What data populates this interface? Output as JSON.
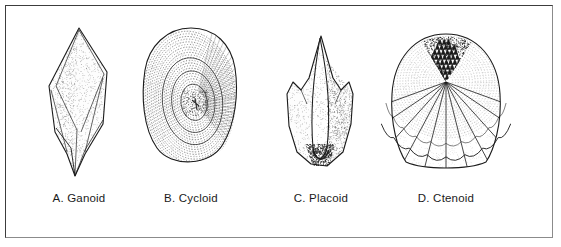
{
  "figure": {
    "background_color": "#ffffff",
    "border_color": "#3c3c3c",
    "ink_color": "#1b1b1b",
    "width": 561,
    "height": 247,
    "caption_font_size": "11.5px"
  },
  "plates": [
    {
      "key": "A.",
      "name": "Ganoid",
      "label": "A.  Ganoid",
      "icon": "ganoid-scale-illustration",
      "description": "rhomboid diamond-shaped scale with pointed tail and stippled shading",
      "center_x": 78
    },
    {
      "key": "B.",
      "name": "Cycloid",
      "label": "B.  Cycloid",
      "icon": "cycloid-scale-illustration",
      "description": "rounded oval scale with concentric growth rings (circuli) around an off-center focus",
      "center_x": 190
    },
    {
      "key": "C.",
      "name": "Placoid",
      "label": "C.  Placoid",
      "icon": "placoid-scale-illustration",
      "description": "tooth-like denticle with a central spine and two lateral cusps, dark shading at base",
      "center_x": 320
    },
    {
      "key": "D.",
      "name": "Ctenoid",
      "label": "D.  Ctenoid",
      "icon": "ctenoid-scale-illustration",
      "description": "fan-shaped scale with radial grooves, scalloped posterior margin and dark comb-like ctenii at top",
      "center_x": 445
    }
  ]
}
